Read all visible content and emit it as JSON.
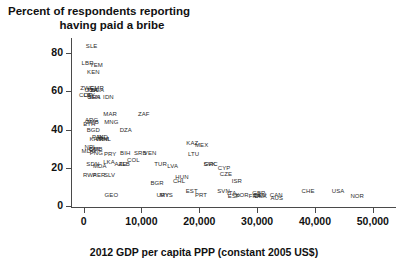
{
  "chart_data": {
    "type": "scatter",
    "title": "Percent of respondents reporting having paid a bribe",
    "title_line1": "Percent of respondents reporting",
    "title_line2": "having paid a bribe",
    "xlabel": "2012 GDP per capita PPP (constant 2005 US$)",
    "ylabel": "",
    "xlim": [
      -2000,
      54000
    ],
    "ylim": [
      0,
      88
    ],
    "grid": false,
    "legend": "none",
    "xticks": [
      0,
      10000,
      20000,
      30000,
      40000,
      50000
    ],
    "xticklabels": [
      "0",
      "10,000",
      "20,000",
      "30,000",
      "40,000",
      "50,000"
    ],
    "yticks": [
      0,
      20,
      40,
      60,
      80
    ],
    "yticklabels": [
      "0",
      "20",
      "40",
      "60",
      "80"
    ],
    "point_label_mode": "country-iso3-text-markers",
    "points": [
      {
        "label": "SLE",
        "x": 1400,
        "y": 84
      },
      {
        "label": "LBR",
        "x": 700,
        "y": 75
      },
      {
        "label": "YEM",
        "x": 2200,
        "y": 74
      },
      {
        "label": "KEN",
        "x": 1700,
        "y": 70
      },
      {
        "label": "ZWE",
        "x": 600,
        "y": 62
      },
      {
        "label": "CMR",
        "x": 2300,
        "y": 62
      },
      {
        "label": "NGA",
        "x": 2400,
        "y": 61
      },
      {
        "label": "TZA",
        "x": 1500,
        "y": 61
      },
      {
        "label": "UGA",
        "x": 1300,
        "y": 61
      },
      {
        "label": "LBY",
        "x": 1000,
        "y": 58
      },
      {
        "label": "COD",
        "x": 400,
        "y": 58
      },
      {
        "label": "GHA",
        "x": 1800,
        "y": 57
      },
      {
        "label": "IDN",
        "x": 4300,
        "y": 57
      },
      {
        "label": "SEN",
        "x": 1800,
        "y": 57
      },
      {
        "label": "MAR",
        "x": 4600,
        "y": 48
      },
      {
        "label": "ZAF",
        "x": 10400,
        "y": 48
      },
      {
        "label": "ARG",
        "x": 1400,
        "y": 45
      },
      {
        "label": "ETH",
        "x": 1000,
        "y": 43
      },
      {
        "label": "ZMB",
        "x": 1500,
        "y": 44
      },
      {
        "label": "MNG",
        "x": 4800,
        "y": 44
      },
      {
        "label": "BGD",
        "x": 1700,
        "y": 40
      },
      {
        "label": "DZA",
        "x": 7300,
        "y": 40
      },
      {
        "label": "IND",
        "x": 3300,
        "y": 36
      },
      {
        "label": "PAK",
        "x": 2500,
        "y": 36
      },
      {
        "label": "VNM",
        "x": 3200,
        "y": 35
      },
      {
        "label": "PHL",
        "x": 3700,
        "y": 35
      },
      {
        "label": "KHM",
        "x": 2200,
        "y": 35
      },
      {
        "label": "KAZ",
        "x": 18800,
        "y": 33
      },
      {
        "label": "MEX",
        "x": 20400,
        "y": 32
      },
      {
        "label": "NPL",
        "x": 1200,
        "y": 31
      },
      {
        "label": "MDG",
        "x": 900,
        "y": 29
      },
      {
        "label": "BOL",
        "x": 2000,
        "y": 30
      },
      {
        "label": "CMB",
        "x": 2100,
        "y": 30
      },
      {
        "label": "PNG",
        "x": 2200,
        "y": 28
      },
      {
        "label": "PRY",
        "x": 4600,
        "y": 27
      },
      {
        "label": "BIH",
        "x": 7200,
        "y": 28
      },
      {
        "label": "SRB",
        "x": 9800,
        "y": 28
      },
      {
        "label": "VEN",
        "x": 11500,
        "y": 28
      },
      {
        "label": "LTU",
        "x": 19000,
        "y": 27
      },
      {
        "label": "SDN",
        "x": 1600,
        "y": 22
      },
      {
        "label": "LKA",
        "x": 4400,
        "y": 23
      },
      {
        "label": "AZE",
        "x": 6400,
        "y": 22
      },
      {
        "label": "ALB",
        "x": 7000,
        "y": 22
      },
      {
        "label": "COL",
        "x": 8600,
        "y": 24
      },
      {
        "label": "MDA",
        "x": 2800,
        "y": 21
      },
      {
        "label": "TUR",
        "x": 13300,
        "y": 22
      },
      {
        "label": "LVA",
        "x": 15400,
        "y": 21
      },
      {
        "label": "SVK",
        "x": 21800,
        "y": 22
      },
      {
        "label": "GRC",
        "x": 22000,
        "y": 22
      },
      {
        "label": "CYP",
        "x": 24300,
        "y": 20
      },
      {
        "label": "CZE",
        "x": 24600,
        "y": 17
      },
      {
        "label": "RWA",
        "x": 1100,
        "y": 16
      },
      {
        "label": "PER",
        "x": 2700,
        "y": 16
      },
      {
        "label": "SLV",
        "x": 4500,
        "y": 16
      },
      {
        "label": "BGR",
        "x": 12700,
        "y": 12
      },
      {
        "label": "CHL",
        "x": 16500,
        "y": 13
      },
      {
        "label": "HUN",
        "x": 17000,
        "y": 15
      },
      {
        "label": "ISR",
        "x": 26500,
        "y": 13
      },
      {
        "label": "GEO",
        "x": 4800,
        "y": 6
      },
      {
        "label": "URY",
        "x": 13700,
        "y": 6
      },
      {
        "label": "MYS",
        "x": 14300,
        "y": 6
      },
      {
        "label": "EST",
        "x": 18700,
        "y": 8
      },
      {
        "label": "PRT",
        "x": 20300,
        "y": 6
      },
      {
        "label": "SVN",
        "x": 24200,
        "y": 8
      },
      {
        "label": "ITA",
        "x": 25600,
        "y": 7
      },
      {
        "label": "ESP",
        "x": 26000,
        "y": 5
      },
      {
        "label": "KOR",
        "x": 27400,
        "y": 6
      },
      {
        "label": "GBR",
        "x": 30300,
        "y": 7
      },
      {
        "label": "DEU",
        "x": 30500,
        "y": 6
      },
      {
        "label": "FRA",
        "x": 29600,
        "y": 5
      },
      {
        "label": "DNK",
        "x": 30600,
        "y": 5
      },
      {
        "label": "CAN",
        "x": 33300,
        "y": 6
      },
      {
        "label": "AUS",
        "x": 33400,
        "y": 4
      },
      {
        "label": "CHE",
        "x": 38800,
        "y": 8
      },
      {
        "label": "USA",
        "x": 44000,
        "y": 8
      },
      {
        "label": "NOR",
        "x": 47300,
        "y": 5
      }
    ]
  }
}
